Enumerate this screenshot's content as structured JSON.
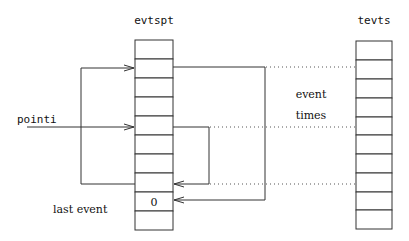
{
  "diagram": {
    "arrays": [
      {
        "id": "evtspt",
        "label": "evtspt",
        "cells": 10,
        "x": 135,
        "y": 40,
        "width": 38,
        "cell_height": 19,
        "cell_values": [
          "",
          "",
          "",
          "",
          "",
          "",
          "",
          "",
          "0",
          ""
        ]
      },
      {
        "id": "tevts",
        "label": "tevts",
        "cells": 10,
        "x": 356,
        "y": 40,
        "width": 36,
        "cell_height": 18.8,
        "cell_values": [
          "",
          "",
          "",
          "",
          "",
          "",
          "",
          "",
          "",
          ""
        ]
      }
    ],
    "labels": {
      "evtspt": "evtspt",
      "tevts": "tevts",
      "pointi": "pointi",
      "event": "event",
      "times": "times",
      "last_event": "last event",
      "zero": "0"
    },
    "connections": [
      {
        "from": "pointi",
        "to": "evtspt[5]",
        "style": "arrow"
      },
      {
        "from": "evtspt[8]",
        "to": "evtspt[2]",
        "style": "arrow",
        "route": "left-bracket"
      },
      {
        "from": "evtspt[2]",
        "to": "evtspt[9]",
        "style": "arrow",
        "route": "right-outer-bracket"
      },
      {
        "from": "evtspt[5]",
        "to": "evtspt[8]",
        "style": "arrow",
        "route": "right-inner-bracket"
      },
      {
        "from": "evtspt[2]",
        "to": "tevts[2]",
        "style": "dotted"
      },
      {
        "from": "evtspt[5]",
        "to": "tevts[5]",
        "style": "dotted"
      },
      {
        "from": "evtspt[8]",
        "to": "tevts[8]",
        "style": "dotted"
      }
    ]
  }
}
